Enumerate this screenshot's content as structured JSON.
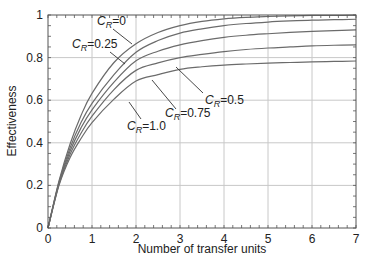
{
  "chart_data": {
    "type": "line",
    "title": "",
    "xlabel": "Number of transfer units",
    "ylabel": "Effectiveness",
    "xlim": [
      0,
      7
    ],
    "ylim": [
      0,
      1
    ],
    "xticks": [
      "0",
      "1",
      "2",
      "3",
      "4",
      "5",
      "6",
      "7"
    ],
    "yticks": [
      "0",
      "0.2",
      "0.4",
      "0.6",
      "0.8",
      "1"
    ],
    "grid": true,
    "legend": "inline labels with leader lines",
    "x": [
      0,
      0.25,
      0.5,
      0.75,
      1,
      1.5,
      2,
      2.5,
      3,
      3.5,
      4,
      4.5,
      5,
      5.5,
      6,
      6.5,
      7
    ],
    "series": [
      {
        "name": "C_R=0",
        "values": [
          0,
          0.221,
          0.393,
          0.528,
          0.632,
          0.777,
          0.865,
          0.918,
          0.95,
          0.97,
          0.982,
          0.989,
          0.993,
          0.996,
          0.998,
          0.998,
          0.999
        ]
      },
      {
        "name": "C_R=0.25",
        "values": [
          0,
          0.215,
          0.375,
          0.495,
          0.585,
          0.72,
          0.825,
          0.88,
          0.915,
          0.935,
          0.95,
          0.96,
          0.967,
          0.972,
          0.976,
          0.978,
          0.98
        ]
      },
      {
        "name": "C_R=0.5",
        "values": [
          0,
          0.21,
          0.36,
          0.47,
          0.555,
          0.685,
          0.785,
          0.83,
          0.86,
          0.88,
          0.895,
          0.905,
          0.912,
          0.918,
          0.923,
          0.927,
          0.93
        ]
      },
      {
        "name": "C_R=0.75",
        "values": [
          0,
          0.205,
          0.345,
          0.445,
          0.525,
          0.65,
          0.74,
          0.775,
          0.8,
          0.815,
          0.828,
          0.838,
          0.845,
          0.85,
          0.855,
          0.858,
          0.86
        ]
      },
      {
        "name": "C_R=1.0",
        "values": [
          0,
          0.2,
          0.33,
          0.42,
          0.495,
          0.605,
          0.69,
          0.72,
          0.745,
          0.757,
          0.765,
          0.77,
          0.774,
          0.777,
          0.78,
          0.782,
          0.784
        ]
      }
    ],
    "annotations": [
      {
        "text": "C_R=0",
        "label_x": 97,
        "label_y": 25,
        "leader": [
          [
            113,
            29
          ],
          [
            132,
            44
          ]
        ]
      },
      {
        "text": "C_R=0.25",
        "label_x": 72,
        "label_y": 48,
        "leader": [
          [
            110,
            52
          ],
          [
            125,
            64
          ]
        ]
      },
      {
        "text": "C_R=0.5",
        "label_x": 205,
        "label_y": 104,
        "leader": [
          [
            203,
            93
          ],
          [
            176,
            67
          ]
        ]
      },
      {
        "text": "C_R=0.75",
        "label_x": 165,
        "label_y": 117,
        "leader": [
          [
            176,
            109
          ],
          [
            152,
            80
          ]
        ]
      },
      {
        "text": "C_R=1.0",
        "label_x": 127,
        "label_y": 130,
        "leader": [
          [
            141,
            119
          ],
          [
            129,
            102
          ]
        ]
      }
    ],
    "label_prefix": "C",
    "label_subscript": "R"
  },
  "colors": {
    "curve": "#6b6b6b",
    "grid": "#c8c8c8",
    "axis": "#555555",
    "text": "#222222"
  }
}
